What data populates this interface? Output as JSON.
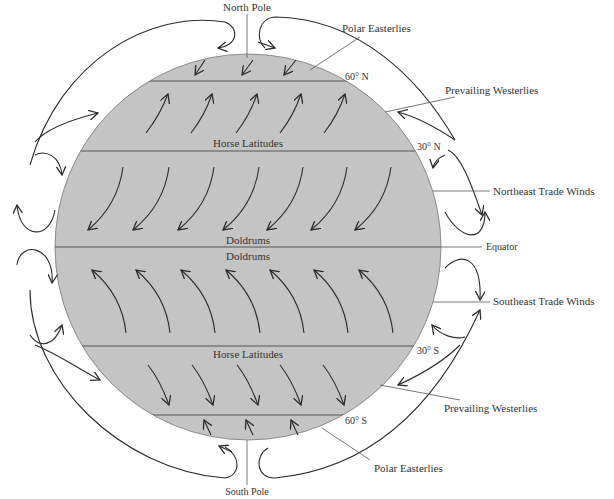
{
  "colors": {
    "globe": "#c4c4c4",
    "lines": "#555555",
    "arrows": "#2a2a2a",
    "background": "#ffffff"
  },
  "labels": {
    "north_pole": "North Pole",
    "south_pole": "South Pole",
    "polar_easterlies_n": "Polar Easterlies",
    "prevailing_westerlies_n": "Prevailing Westerlies",
    "northeast_trade_winds": "Northeast Trade Winds",
    "equator": "Equator",
    "southeast_trade_winds": "Southeast Trade Winds",
    "prevailing_westerlies_s": "Prevailing Westerlies",
    "polar_easterlies_s": "Polar Easterlies"
  },
  "latitudes": {
    "lat_60n": "60° N",
    "lat_30n": "30° N",
    "lat_30s": "30° S",
    "lat_60s": "60° S"
  },
  "zones": {
    "horse_latitudes_n": "Horse Latitudes",
    "doldrums_n": "Doldrums",
    "doldrums_s": "Doldrums",
    "horse_latitudes_s": "Horse Latitudes"
  }
}
